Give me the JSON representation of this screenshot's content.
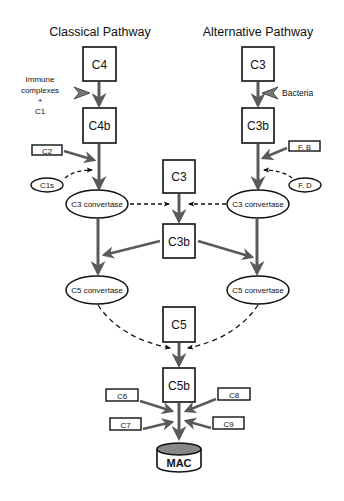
{
  "titles": {
    "classical": "Classical Pathway",
    "alternative": "Alternative Pathway"
  },
  "classical": {
    "c4": "C4",
    "activator_line1": "Immune",
    "activator_line2": "complexes",
    "activator_line3": "+",
    "activator_line4": "C1",
    "c4b": "C4b",
    "c2": "C2",
    "c1s": "C1s",
    "c3_convertase": "C3 convertase",
    "c5_convertase": "C5 convertase"
  },
  "alternative": {
    "c3": "C3",
    "activator": "Bacteria",
    "c3b": "C3b",
    "fb": "F. B",
    "fd": "F. D",
    "c3_convertase": "C3 convertase",
    "c5_convertase": "C5 convertase"
  },
  "central": {
    "c3": "C3",
    "c3b": "C3b",
    "c5": "C5",
    "c5b": "C5b",
    "c6": "C6",
    "c7": "C7",
    "c8": "C8",
    "c9": "C9",
    "mac": "MAC"
  },
  "colors": {
    "stroke": "#111111",
    "arrow": "#5a5a5a",
    "mac_top": "#888888"
  }
}
